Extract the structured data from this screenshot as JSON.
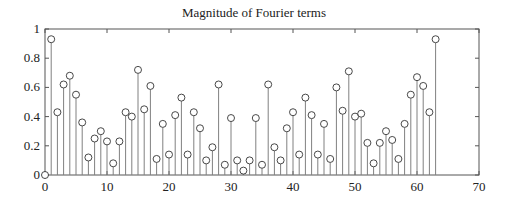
{
  "chart_data": {
    "type": "stem",
    "title": "Magnitude of Fourier terms",
    "xlabel": "",
    "ylabel": "",
    "xlim": [
      0,
      70
    ],
    "ylim": [
      0,
      1
    ],
    "grid": false,
    "legend": null,
    "xticks": [
      0,
      10,
      20,
      30,
      40,
      50,
      60,
      70
    ],
    "yticks": [
      0,
      0.2,
      0.4,
      0.6,
      0.8,
      1
    ],
    "ytick_labels": [
      "0",
      "0.2",
      "0.4",
      "0.6",
      "0.8",
      "1"
    ],
    "x": [
      0,
      1,
      2,
      3,
      4,
      5,
      6,
      7,
      8,
      9,
      10,
      11,
      12,
      13,
      14,
      15,
      16,
      17,
      18,
      19,
      20,
      21,
      22,
      23,
      24,
      25,
      26,
      27,
      28,
      29,
      30,
      31,
      32,
      33,
      34,
      35,
      36,
      37,
      38,
      39,
      40,
      41,
      42,
      43,
      44,
      45,
      46,
      47,
      48,
      49,
      50,
      51,
      52,
      53,
      54,
      55,
      56,
      57,
      58,
      59,
      60,
      61,
      62,
      63
    ],
    "values": [
      0,
      0.93,
      0.43,
      0.62,
      0.68,
      0.55,
      0.36,
      0.12,
      0.25,
      0.3,
      0.23,
      0.08,
      0.23,
      0.43,
      0.4,
      0.72,
      0.45,
      0.61,
      0.11,
      0.35,
      0.14,
      0.41,
      0.53,
      0.14,
      0.43,
      0.32,
      0.1,
      0.19,
      0.62,
      0.07,
      0.39,
      0.1,
      0.03,
      0.1,
      0.39,
      0.07,
      0.62,
      0.19,
      0.1,
      0.32,
      0.43,
      0.14,
      0.53,
      0.41,
      0.14,
      0.35,
      0.11,
      0.6,
      0.44,
      0.71,
      0.4,
      0.42,
      0.22,
      0.08,
      0.22,
      0.3,
      0.24,
      0.11,
      0.35,
      0.55,
      0.67,
      0.61,
      0.43,
      0.93
    ],
    "marker": "open-circle",
    "stem_color": "#808080",
    "marker_color": "#333333",
    "axis_color": "#555555"
  }
}
